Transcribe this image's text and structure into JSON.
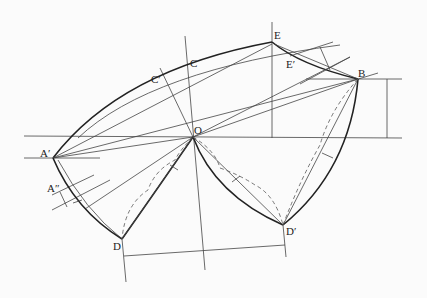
{
  "labels": {
    "E": "E",
    "E_prime": "E′",
    "B": "B",
    "C": "C",
    "C_prime": "C′",
    "O": "O",
    "A_prime": "A′",
    "A_double_prime": "A″",
    "D": "D",
    "D_prime": "D′"
  }
}
